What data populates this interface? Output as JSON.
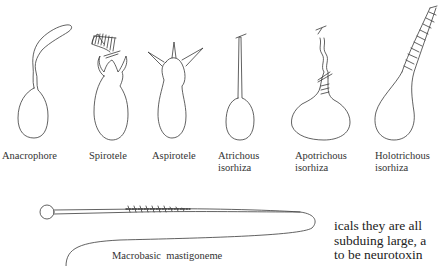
{
  "figure": {
    "labels": [
      {
        "id": "anacrophore",
        "lines": [
          "Anacrophore"
        ]
      },
      {
        "id": "spirotele",
        "lines": [
          "Spirotele"
        ]
      },
      {
        "id": "aspirotele",
        "lines": [
          "Aspirotele"
        ]
      },
      {
        "id": "atrichous",
        "lines": [
          "Atrichous",
          "isorhiza"
        ]
      },
      {
        "id": "apotrichous",
        "lines": [
          "Apotrichous",
          "isorhiza"
        ]
      },
      {
        "id": "holotrichous",
        "lines": [
          "Holotrichous",
          "isorhiza"
        ]
      },
      {
        "id": "macrobasic",
        "lines": [
          "Macrobasic  mastigoneme"
        ]
      }
    ]
  },
  "body_text": {
    "lines": [
      "icals they are all",
      "subduing large, a",
      "to be neurotoxin"
    ]
  },
  "colors": {
    "line": "#3a3a3a",
    "background": "#ffffff"
  }
}
